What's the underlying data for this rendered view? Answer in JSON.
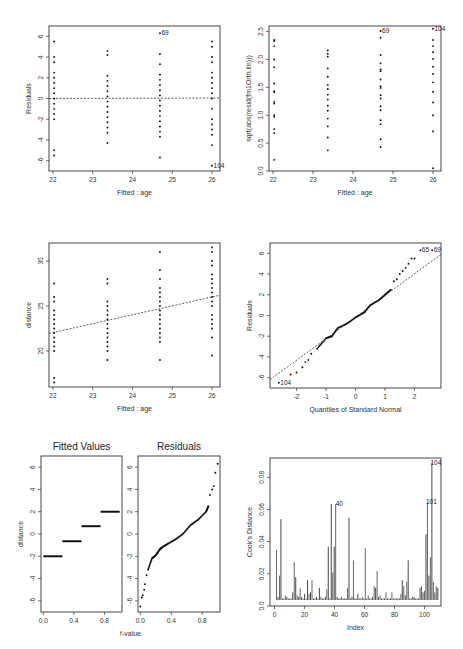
{
  "figure": {
    "panels": [
      {
        "id": "residuals-vs-fitted",
        "xlabel": "Fitted : age",
        "ylabel": "Residuals"
      },
      {
        "id": "sqrt-abs-residuals-vs-fitted",
        "xlabel": "Fitted : age",
        "ylabel": "sqrt(abs(resid(fm1Orth.lm)))"
      },
      {
        "id": "response-vs-fitted",
        "xlabel": "Fitted : age",
        "ylabel": "distance"
      },
      {
        "id": "normal-qq",
        "xlabel": "Quantiles of Standard Normal",
        "ylabel": "Residuals"
      },
      {
        "id": "rf-spread",
        "titles": [
          "Fitted Values",
          "Residuals"
        ],
        "xlabel": "f-value",
        "ylabel": "distance"
      },
      {
        "id": "cooks-distance",
        "xlabel": "Index",
        "ylabel": "Cook's Distance"
      }
    ]
  },
  "chart_data": [
    {
      "type": "scatter",
      "title": "",
      "xlabel": "Fitted : age",
      "ylabel": "Residuals",
      "xlim": [
        21.9,
        26.2
      ],
      "ylim": [
        -7,
        7
      ],
      "xticks": [
        22,
        23,
        24,
        25,
        26
      ],
      "yticks": [
        -6,
        -4,
        -2,
        0,
        2,
        4,
        6
      ],
      "reference_line": {
        "type": "horizontal",
        "y": 0,
        "style": "dotted"
      },
      "groups": [
        {
          "x": 22.03,
          "y": [
            5.5,
            4.0,
            3.5,
            2.5,
            2.0,
            1.5,
            1.0,
            0.5,
            0.0,
            -0.5,
            -1.0,
            -1.5,
            -2.0,
            -5.0,
            -5.5
          ]
        },
        {
          "x": 23.37,
          "y": [
            4.6,
            4.2,
            2.2,
            1.7,
            1.2,
            0.7,
            0.2,
            -0.3,
            -0.8,
            -1.3,
            -1.8,
            -2.3,
            -2.8,
            -3.3,
            -4.3
          ]
        },
        {
          "x": 24.69,
          "y": [
            6.3,
            4.3,
            3.3,
            2.3,
            1.8,
            1.3,
            0.8,
            0.3,
            -0.2,
            -0.7,
            -1.2,
            -1.7,
            -2.2,
            -2.7,
            -3.2,
            -3.7,
            -5.7
          ]
        },
        {
          "x": 26.0,
          "y": [
            5.5,
            5.0,
            4.0,
            3.5,
            2.5,
            2.0,
            1.5,
            1.0,
            0.5,
            0.0,
            -1.0,
            -2.0,
            -2.5,
            -3.0,
            -3.5,
            -4.5,
            -6.5
          ]
        }
      ],
      "annotations": [
        {
          "label": "69",
          "x": 24.69,
          "y": 6.3
        },
        {
          "label": "104",
          "x": 26.0,
          "y": -6.5
        }
      ]
    },
    {
      "type": "scatter",
      "title": "",
      "xlabel": "Fitted : age",
      "ylabel": "sqrt(abs(resid(fm1Orth.lm)))",
      "xlim": [
        21.9,
        26.2
      ],
      "ylim": [
        0,
        2.6
      ],
      "xticks": [
        22,
        23,
        24,
        25,
        26
      ],
      "yticks": [
        0.0,
        0.5,
        1.0,
        1.5,
        2.0,
        2.5
      ],
      "groups": [
        {
          "x": 22.03,
          "y": [
            2.35,
            2.33,
            2.24,
            2.0,
            1.86,
            1.57,
            1.43,
            1.41,
            1.24,
            1.21,
            1.0,
            0.97,
            0.75,
            0.68,
            0.2
          ]
        },
        {
          "x": 23.37,
          "y": [
            2.16,
            2.1,
            2.05,
            1.84,
            1.69,
            1.54,
            1.47,
            1.37,
            1.28,
            1.17,
            1.08,
            0.94,
            0.8,
            0.6,
            0.37
          ]
        },
        {
          "x": 24.69,
          "y": [
            2.51,
            2.39,
            2.08,
            1.93,
            1.82,
            1.79,
            1.64,
            1.52,
            1.49,
            1.36,
            1.3,
            1.16,
            1.09,
            0.91,
            0.84,
            0.57,
            0.43
          ]
        },
        {
          "x": 26.0,
          "y": [
            2.55,
            2.35,
            2.24,
            2.13,
            2.01,
            1.87,
            1.74,
            1.59,
            1.42,
            1.23,
            1.0,
            0.71,
            0.05
          ]
        }
      ],
      "annotations": [
        {
          "label": "69",
          "x": 24.69,
          "y": 2.51
        },
        {
          "label": "104",
          "x": 26.0,
          "y": 2.55
        }
      ]
    },
    {
      "type": "scatter",
      "title": "",
      "xlabel": "Fitted : age",
      "ylabel": "distance",
      "xlim": [
        21.9,
        26.2
      ],
      "ylim": [
        16,
        32
      ],
      "xticks": [
        22,
        23,
        24,
        25,
        26
      ],
      "yticks": [
        20,
        25,
        30
      ],
      "reference_line": {
        "type": "fit",
        "from": [
          21.9,
          21.95
        ],
        "to": [
          26.2,
          26.2
        ],
        "style": "dotted"
      },
      "groups": [
        {
          "x": 22.03,
          "y": [
            27.5,
            26.0,
            25.5,
            24.5,
            24.0,
            23.5,
            23.0,
            22.5,
            22.0,
            21.5,
            21.0,
            20.5,
            20.0,
            17.0,
            16.5
          ]
        },
        {
          "x": 23.37,
          "y": [
            28.0,
            27.5,
            25.5,
            25.0,
            24.5,
            24.0,
            23.5,
            23.0,
            22.5,
            22.0,
            21.5,
            21.0,
            20.5,
            20.0,
            19.0
          ]
        },
        {
          "x": 24.69,
          "y": [
            31.0,
            29.0,
            28.0,
            27.0,
            26.5,
            26.0,
            25.5,
            25.0,
            24.5,
            24.0,
            23.5,
            23.0,
            22.5,
            22.0,
            21.5,
            21.0,
            19.0
          ]
        },
        {
          "x": 26.0,
          "y": [
            31.5,
            31.0,
            30.0,
            29.5,
            28.5,
            28.0,
            27.5,
            27.0,
            26.5,
            26.0,
            25.5,
            25.0,
            24.0,
            23.5,
            23.0,
            22.5,
            21.5,
            19.5
          ]
        }
      ]
    },
    {
      "type": "scatter",
      "title": "",
      "xlabel": "Quantiles of Standard Normal",
      "ylabel": "Residuals",
      "xlim": [
        -2.9,
        2.9
      ],
      "ylim": [
        -7,
        7
      ],
      "xticks": [
        -2,
        -1,
        0,
        1,
        2
      ],
      "yticks": [
        -6,
        -4,
        -2,
        0,
        2,
        4,
        6
      ],
      "reference_line": {
        "type": "qqline",
        "from": [
          -2.9,
          -6.2
        ],
        "to": [
          2.9,
          5.9
        ],
        "style": "dotted"
      },
      "qq_curve": [
        [
          -2.6,
          -6.5
        ],
        [
          -2.2,
          -5.7
        ],
        [
          -2.0,
          -5.5
        ],
        [
          -1.8,
          -5.0
        ],
        [
          -1.7,
          -4.5
        ],
        [
          -1.6,
          -4.3
        ],
        [
          -1.5,
          -3.7
        ],
        [
          -1.3,
          -3.2
        ],
        [
          -1.0,
          -2.2
        ],
        [
          -0.8,
          -2.0
        ],
        [
          -0.6,
          -1.2
        ],
        [
          -0.3,
          -0.8
        ],
        [
          0.0,
          -0.2
        ],
        [
          0.3,
          0.3
        ],
        [
          0.5,
          1.0
        ],
        [
          0.8,
          1.5
        ],
        [
          1.0,
          2.0
        ],
        [
          1.2,
          2.5
        ],
        [
          1.3,
          3.3
        ],
        [
          1.4,
          3.5
        ],
        [
          1.5,
          4.0
        ],
        [
          1.6,
          4.3
        ],
        [
          1.7,
          4.6
        ],
        [
          1.8,
          5.0
        ],
        [
          1.9,
          5.5
        ],
        [
          2.0,
          5.5
        ],
        [
          2.2,
          6.3
        ],
        [
          2.6,
          6.3
        ]
      ],
      "annotations": [
        {
          "label": "104",
          "x": -2.6,
          "y": -6.5
        },
        {
          "label": "65",
          "x": 2.2,
          "y": 6.3
        },
        {
          "label": "69",
          "x": 2.6,
          "y": 6.3
        }
      ]
    },
    {
      "type": "scatter",
      "title": "Fitted Values / Residuals (residual-fit spread)",
      "subplots": [
        {
          "title": "Fitted Values",
          "xlabel": "f-value",
          "ylabel": "distance",
          "xlim": [
            -0.03,
            1.03
          ],
          "ylim": [
            -7,
            7
          ],
          "xticks": [
            0.0,
            0.4,
            0.8
          ],
          "yticks": [
            -6,
            -4,
            -2,
            0,
            2,
            4,
            6
          ],
          "segments": [
            {
              "x0": 0.0,
              "x1": 0.25,
              "y": -2.0
            },
            {
              "x0": 0.25,
              "x1": 0.5,
              "y": -0.65
            },
            {
              "x0": 0.5,
              "x1": 0.75,
              "y": 0.7
            },
            {
              "x0": 0.75,
              "x1": 1.0,
              "y": 2.0
            }
          ]
        },
        {
          "title": "Residuals",
          "xlabel": "f-value",
          "ylabel": "",
          "xlim": [
            -0.03,
            1.03
          ],
          "ylim": [
            -7,
            7
          ],
          "xticks": [
            0.0,
            0.4,
            0.8
          ],
          "yticks": [
            -6,
            -4,
            -2,
            0,
            2,
            4,
            6
          ],
          "curve": [
            [
              0.0,
              -6.5
            ],
            [
              0.02,
              -5.7
            ],
            [
              0.03,
              -5.5
            ],
            [
              0.05,
              -5.0
            ],
            [
              0.06,
              -4.5
            ],
            [
              0.08,
              -3.7
            ],
            [
              0.1,
              -3.2
            ],
            [
              0.15,
              -2.2
            ],
            [
              0.2,
              -1.9
            ],
            [
              0.25,
              -1.4
            ],
            [
              0.28,
              -1.2
            ],
            [
              0.35,
              -0.9
            ],
            [
              0.45,
              -0.5
            ],
            [
              0.55,
              0.0
            ],
            [
              0.65,
              0.8
            ],
            [
              0.75,
              1.3
            ],
            [
              0.85,
              2.0
            ],
            [
              0.88,
              2.5
            ],
            [
              0.9,
              3.5
            ],
            [
              0.93,
              4.0
            ],
            [
              0.95,
              4.3
            ],
            [
              0.97,
              5.5
            ],
            [
              1.0,
              6.3
            ]
          ]
        }
      ]
    },
    {
      "type": "bar",
      "title": "",
      "xlabel": "Index",
      "ylabel": "Cook's Distance",
      "xlim": [
        -3,
        111
      ],
      "ylim": [
        0,
        0.092
      ],
      "xticks": [
        0,
        20,
        40,
        60,
        80,
        100
      ],
      "yticks": [
        0.0,
        0.02,
        0.04,
        0.06,
        0.08
      ],
      "values": [
        0.033,
        0.002,
        0.016,
        0.053,
        0.001,
        0.001,
        0.003,
        0.002,
        0.001,
        0.001,
        0.001,
        0.005,
        0.025,
        0.015,
        0.003,
        0.002,
        0.008,
        0.002,
        0.001,
        0.004,
        0.001,
        0.013,
        0.004,
        0.005,
        0.013,
        0.001,
        0.001,
        0.002,
        0.001,
        0.008,
        0.002,
        0.001,
        0.001,
        0.002,
        0.007,
        0.035,
        0.001,
        0.063,
        0.018,
        0.035,
        0.063,
        0.002,
        0.001,
        0.001,
        0.002,
        0.001,
        0.001,
        0.001,
        0.008,
        0.054,
        0.001,
        0.002,
        0.026,
        0.001,
        0.001,
        0.004,
        0.001,
        0.001,
        0.002,
        0.001,
        0.034,
        0.001,
        0.003,
        0.001,
        0.001,
        0.002,
        0.009,
        0.008,
        0.019,
        0.002,
        0.003,
        0.001,
        0.001,
        0.001,
        0.005,
        0.001,
        0.001,
        0.001,
        0.005,
        0.001,
        0.001,
        0.001,
        0.001,
        0.001,
        0.004,
        0.013,
        0.009,
        0.003,
        0.012,
        0.026,
        0.001,
        0.001,
        0.002,
        0.002,
        0.001,
        0.001,
        0.001,
        0.008,
        0.009,
        0.005,
        0.006,
        0.043,
        0.064,
        0.016,
        0.028,
        0.09,
        0.012,
        0.005,
        0.009,
        0.008
      ],
      "annotations": [
        {
          "label": "40",
          "index": 40,
          "value": 0.063
        },
        {
          "label": "101",
          "index": 101,
          "value": 0.064
        },
        {
          "label": "104",
          "index": 104,
          "value": 0.09
        }
      ]
    }
  ]
}
